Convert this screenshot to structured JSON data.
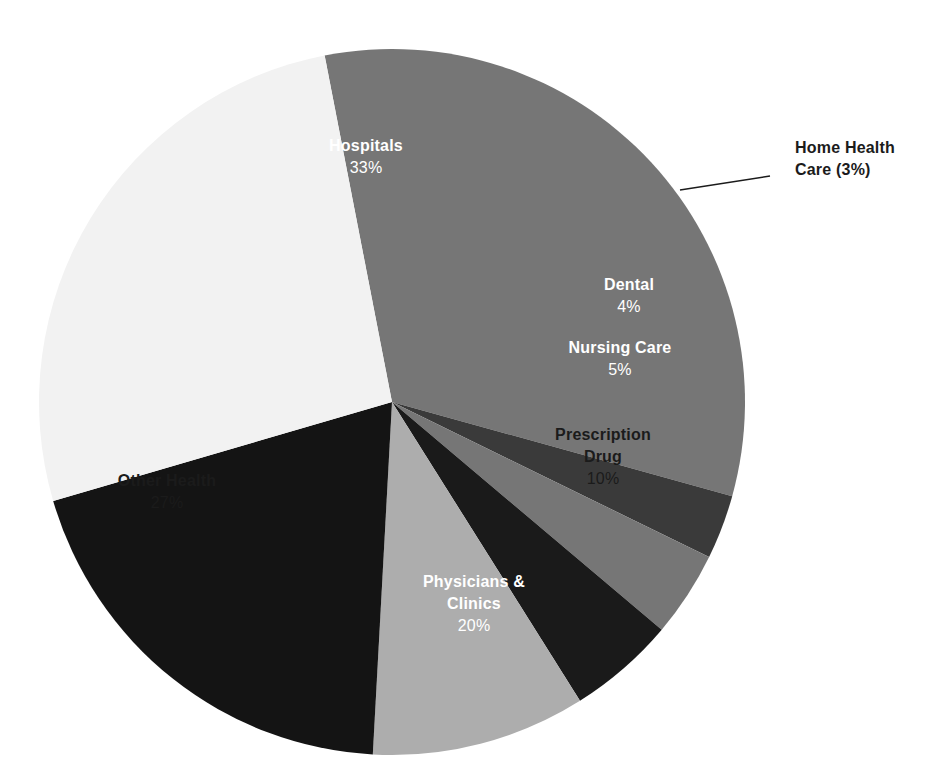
{
  "chart_data": {
    "type": "pie",
    "title": "",
    "subtitle": "",
    "xlabel": "",
    "ylabel": "",
    "legend_position": "none",
    "grid": false,
    "value_unit": "%",
    "total": 102,
    "categories": [
      "Hospitals",
      "Home Health Care",
      "Dental",
      "Nursing Care",
      "Prescription Drug",
      "Physicians & Clinics",
      "Other Health"
    ],
    "values": [
      33,
      3,
      4,
      5,
      10,
      20,
      27
    ],
    "slices": [
      {
        "label": "Hospitals",
        "value": 33,
        "value_text": "33%",
        "color": "#767676",
        "label_color": "#ffffff",
        "label_mode": "inside",
        "label_lines": [
          "Hospitals",
          "33%"
        ],
        "label_x": 366,
        "label_y": 158
      },
      {
        "label": "Home Health Care",
        "value": 3,
        "value_text": "3%",
        "color": "#3a3a3a",
        "label_color": "#1b1b1b",
        "label_mode": "callout",
        "label_lines": [
          "Home Health",
          "Care (3%)"
        ],
        "label_x": 795,
        "label_y": 160
      },
      {
        "label": "Dental",
        "value": 4,
        "value_text": "4%",
        "color": "#767676",
        "label_color": "#ffffff",
        "label_mode": "inside",
        "label_lines": [
          "Dental",
          "4%"
        ],
        "label_x": 629,
        "label_y": 297
      },
      {
        "label": "Nursing Care",
        "value": 5,
        "value_text": "5%",
        "color": "#1a1a1a",
        "label_color": "#ffffff",
        "label_mode": "inside",
        "label_lines": [
          "Nursing Care",
          "5%"
        ],
        "label_x": 620,
        "label_y": 360
      },
      {
        "label": "Prescription Drug",
        "value": 10,
        "value_text": "10%",
        "color": "#adadad",
        "label_color": "#1b1b1b",
        "label_mode": "inside",
        "label_lines": [
          "Prescription",
          "Drug",
          "10%"
        ],
        "label_x": 603,
        "label_y": 458
      },
      {
        "label": "Physicians & Clinics",
        "value": 20,
        "value_text": "20%",
        "color": "#141414",
        "label_color": "#ffffff",
        "label_mode": "inside",
        "label_lines": [
          "Physicians &",
          "Clinics",
          "20%"
        ],
        "label_x": 474,
        "label_y": 605
      },
      {
        "label": "Other Health",
        "value": 27,
        "value_text": "27%",
        "color": "#f2f2f2",
        "label_color": "#1b1b1b",
        "label_mode": "inside",
        "label_lines": [
          "Other Health",
          "27%"
        ],
        "label_x": 167,
        "label_y": 493
      }
    ],
    "geometry": {
      "center_x": 392,
      "center_y": 402,
      "radius": 353,
      "start_angle_deg": -11,
      "direction": "clockwise"
    },
    "callout": {
      "leader_from_x": 680,
      "leader_from_y": 190,
      "leader_to_x": 770,
      "leader_to_y": 176
    }
  }
}
